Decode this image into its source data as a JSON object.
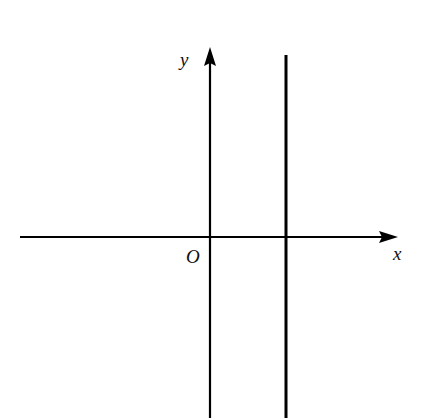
{
  "diagram": {
    "type": "coordinate-axes",
    "labels": {
      "x_axis": "x",
      "y_axis": "y",
      "origin": "O"
    },
    "elements": [
      {
        "kind": "x-axis",
        "direction": "right",
        "arrow": true
      },
      {
        "kind": "y-axis",
        "direction": "up",
        "arrow": true
      },
      {
        "kind": "vertical-line",
        "position": "x > 0, to the right of the y-axis"
      }
    ],
    "colors": {
      "stroke": "#000000",
      "background": "#ffffff"
    }
  }
}
